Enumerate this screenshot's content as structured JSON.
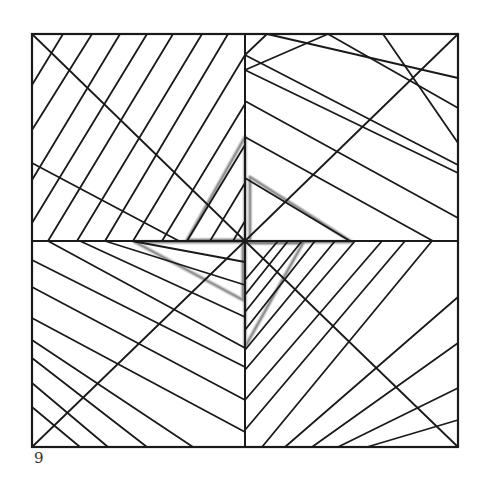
{
  "figure": {
    "number_label": "9",
    "square": {
      "x1": 32,
      "y1": 34,
      "x2": 458,
      "y2": 447
    },
    "center": {
      "x": 245,
      "y": 241
    },
    "stroke_color": "#1a1a1a",
    "pencil_color": "#7a7a7a",
    "lines": [
      [
        32,
        34,
        245,
        241
      ],
      [
        458,
        34,
        245,
        241
      ],
      [
        32,
        447,
        245,
        241
      ],
      [
        458,
        447,
        245,
        241
      ],
      [
        32,
        163,
        179,
        241
      ],
      [
        32,
        85,
        63,
        34
      ],
      [
        32,
        130,
        92,
        34
      ],
      [
        32,
        180,
        120,
        34
      ],
      [
        32,
        223,
        147,
        34
      ],
      [
        48,
        241,
        173,
        34
      ],
      [
        77,
        241,
        202,
        34
      ],
      [
        105,
        241,
        228,
        34
      ],
      [
        133,
        241,
        245,
        55
      ],
      [
        162,
        241,
        245,
        104
      ],
      [
        187,
        241,
        245,
        145
      ],
      [
        210,
        241,
        245,
        183
      ],
      [
        233,
        241,
        245,
        221
      ],
      [
        245,
        55,
        267,
        34
      ],
      [
        245,
        55,
        458,
        165
      ],
      [
        245,
        70,
        328,
        34
      ],
      [
        245,
        101,
        458,
        218
      ],
      [
        245,
        137,
        433,
        241
      ],
      [
        245,
        178,
        350,
        241
      ],
      [
        267,
        34,
        458,
        78
      ],
      [
        328,
        34,
        458,
        108
      ],
      [
        383,
        34,
        458,
        143
      ],
      [
        245,
        70,
        458,
        173
      ],
      [
        32,
        260,
        245,
        367
      ],
      [
        32,
        287,
        245,
        400
      ],
      [
        32,
        318,
        245,
        432
      ],
      [
        32,
        340,
        193,
        447
      ],
      [
        32,
        358,
        147,
        447
      ],
      [
        32,
        383,
        108,
        447
      ],
      [
        32,
        407,
        80,
        447
      ],
      [
        48,
        241,
        245,
        348
      ],
      [
        80,
        241,
        245,
        317
      ],
      [
        105,
        241,
        245,
        285
      ],
      [
        132,
        241,
        245,
        262
      ],
      [
        262,
        447,
        432,
        241
      ],
      [
        285,
        447,
        458,
        297
      ],
      [
        312,
        447,
        458,
        343
      ],
      [
        338,
        447,
        458,
        388
      ],
      [
        367,
        447,
        458,
        420
      ],
      [
        245,
        430,
        405,
        241
      ],
      [
        245,
        400,
        382,
        241
      ],
      [
        245,
        370,
        355,
        241
      ],
      [
        245,
        350,
        335,
        241
      ],
      [
        245,
        330,
        315,
        241
      ],
      [
        245,
        312,
        302,
        241
      ],
      [
        245,
        295,
        288,
        241
      ],
      [
        245,
        280,
        278,
        241
      ]
    ],
    "pencil_paths": [
      [
        [
          245,
          137
        ],
        [
          187,
          240
        ],
        [
          245,
          240
        ]
      ],
      [
        [
          250,
          177
        ],
        [
          352,
          242
        ],
        [
          250,
          242
        ]
      ],
      [
        [
          245,
          347
        ],
        [
          303,
          243
        ],
        [
          245,
          243
        ]
      ],
      [
        [
          135,
          242
        ],
        [
          243,
          300
        ],
        [
          243,
          242
        ]
      ]
    ]
  }
}
